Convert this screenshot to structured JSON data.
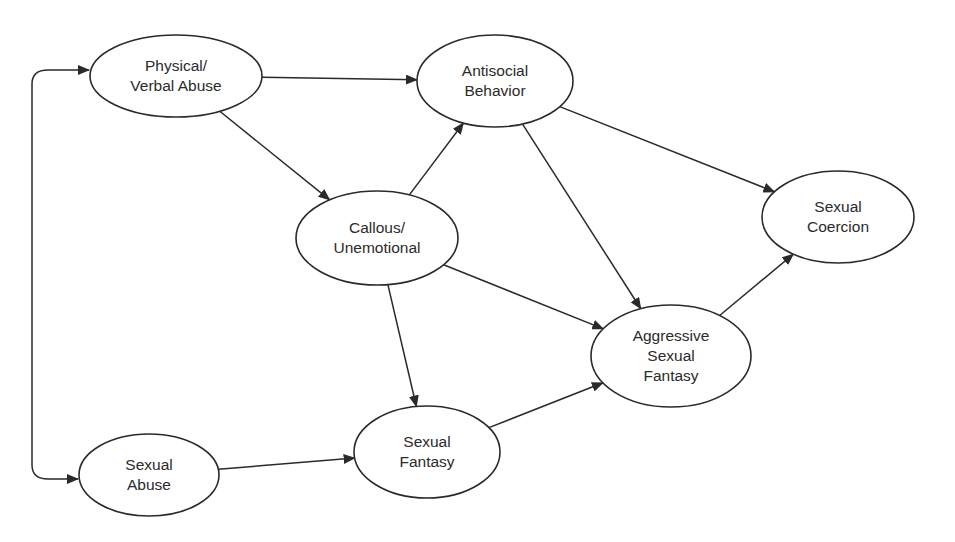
{
  "diagram": {
    "type": "path-diagram",
    "line_color": "#2a2a2a",
    "text_color": "#2b2b2b",
    "nodes": [
      {
        "id": "physical_verbal_abuse",
        "lines": [
          "Physical/",
          "Verbal Abuse"
        ],
        "cx": 176,
        "cy": 76,
        "rx": 86,
        "ry": 41
      },
      {
        "id": "antisocial_behavior",
        "lines": [
          "Antisocial",
          "Behavior"
        ],
        "cx": 495,
        "cy": 81,
        "rx": 78,
        "ry": 46
      },
      {
        "id": "callous_unemotional",
        "lines": [
          "Callous/",
          "Unemotional"
        ],
        "cx": 377,
        "cy": 238,
        "rx": 81,
        "ry": 47
      },
      {
        "id": "sexual_coercion",
        "lines": [
          "Sexual",
          "Coercion"
        ],
        "cx": 838,
        "cy": 217,
        "rx": 76,
        "ry": 46
      },
      {
        "id": "aggressive_sexual_fantasy",
        "lines": [
          "Aggressive",
          "Sexual",
          "Fantasy"
        ],
        "cx": 671,
        "cy": 356,
        "rx": 80,
        "ry": 51
      },
      {
        "id": "sexual_fantasy",
        "lines": [
          "Sexual",
          "Fantasy"
        ],
        "cx": 427,
        "cy": 452,
        "rx": 73,
        "ry": 46
      },
      {
        "id": "sexual_abuse",
        "lines": [
          "Sexual",
          "Abuse"
        ],
        "cx": 149,
        "cy": 475,
        "rx": 70,
        "ry": 41
      }
    ],
    "edges": [
      {
        "from": "physical_verbal_abuse",
        "to": "antisocial_behavior"
      },
      {
        "from": "physical_verbal_abuse",
        "to": "callous_unemotional"
      },
      {
        "from": "callous_unemotional",
        "to": "antisocial_behavior"
      },
      {
        "from": "callous_unemotional",
        "to": "aggressive_sexual_fantasy"
      },
      {
        "from": "callous_unemotional",
        "to": "sexual_fantasy"
      },
      {
        "from": "antisocial_behavior",
        "to": "sexual_coercion"
      },
      {
        "from": "antisocial_behavior",
        "to": "aggressive_sexual_fantasy"
      },
      {
        "from": "aggressive_sexual_fantasy",
        "to": "sexual_coercion"
      },
      {
        "from": "sexual_fantasy",
        "to": "aggressive_sexual_fantasy"
      },
      {
        "from": "sexual_abuse",
        "to": "sexual_fantasy"
      }
    ],
    "correlations": [
      {
        "between": [
          "physical_verbal_abuse",
          "sexual_abuse"
        ],
        "style": "double-headed curved bracket on left"
      }
    ]
  }
}
